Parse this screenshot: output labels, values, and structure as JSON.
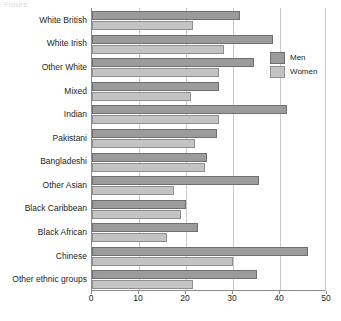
{
  "title_fragment": "Figure",
  "legend": {
    "position": "top-right",
    "entries": [
      {
        "label": "Men",
        "color": "#9b9b9b"
      },
      {
        "label": "Women",
        "color": "#c3c3c3"
      }
    ]
  },
  "axis": {
    "ticks": [
      "0",
      "10",
      "20",
      "30",
      "40",
      "50"
    ],
    "tick_values": [
      0,
      10,
      20,
      30,
      40,
      50
    ]
  },
  "chart_data": {
    "type": "bar",
    "orientation": "horizontal",
    "title": "",
    "xlabel": "",
    "ylabel": "",
    "xlim": [
      0,
      50
    ],
    "grid": true,
    "legend_position": "top-right",
    "categories": [
      "White British",
      "White Irish",
      "Other White",
      "Mixed",
      "Indian",
      "Pakistani",
      "Bangladeshi",
      "Other Asian",
      "Black Caribbean",
      "Black African",
      "Chinese",
      "Other ethnic groups"
    ],
    "series": [
      {
        "name": "Men",
        "color": "#9b9b9b",
        "values": [
          31.5,
          38.5,
          34.5,
          27,
          41.5,
          26.5,
          24.5,
          35.5,
          20,
          22.5,
          46,
          35
        ]
      },
      {
        "name": "Women",
        "color": "#c3c3c3",
        "values": [
          21.5,
          28,
          27,
          21,
          27,
          22,
          24,
          17.5,
          19,
          16,
          30,
          21.5
        ]
      }
    ]
  }
}
